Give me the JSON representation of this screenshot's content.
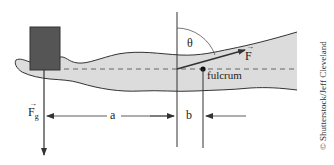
{
  "diagram": {
    "labels": {
      "weight_force": "F",
      "weight_force_sub": "g",
      "applied_force": "F",
      "angle": "θ",
      "fulcrum": "fulcrum",
      "distance_a": "a",
      "distance_b": "b"
    },
    "credit": "© Shutterstock/Jeff Cleveland",
    "colors": {
      "arm_fill": "#dcdcdc",
      "arm_outline": "#333333",
      "weight_block": "#555555",
      "lines": "#333333"
    }
  }
}
